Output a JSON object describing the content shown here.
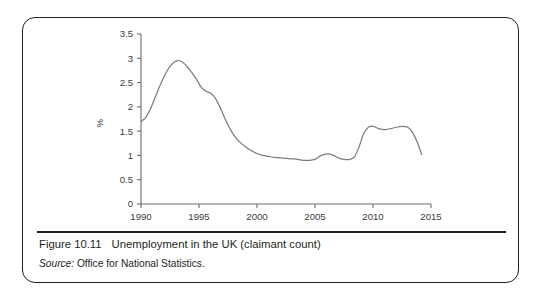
{
  "figure": {
    "number_label": "Figure 10.11",
    "title": "Unemployment in the UK (claimant count)",
    "source_label": "Source:",
    "source_text": " Office for National Statistics."
  },
  "colors": {
    "border": "#231f20",
    "series_line": "#7c7c7c",
    "axis": "#6b6b6b",
    "tick_text": "#3a3a3a",
    "background": "#ffffff"
  },
  "chart_data": {
    "type": "line",
    "title": "",
    "xlabel": "",
    "ylabel": "%",
    "xlim": [
      1990,
      2015
    ],
    "ylim": [
      0,
      3.5
    ],
    "grid": false,
    "legend": "none",
    "x_ticks": [
      "1990",
      "1995",
      "2000",
      "2005",
      "2010",
      "2015"
    ],
    "x_tick_values": [
      1990,
      1995,
      2000,
      2005,
      2010,
      2015
    ],
    "y_ticks": [
      "0",
      "0.5",
      "1",
      "1.5",
      "2",
      "2.5",
      "3",
      "3.5"
    ],
    "y_tick_values": [
      0,
      0.5,
      1,
      1.5,
      2,
      2.5,
      3,
      3.5
    ],
    "series": [
      {
        "name": "Unemployment (claimant count)",
        "color": "#7c7c7c",
        "x": [
          1990.0,
          1990.4,
          1990.8,
          1991.2,
          1991.6,
          1992.0,
          1992.4,
          1992.8,
          1993.2,
          1993.6,
          1994.0,
          1994.4,
          1994.8,
          1995.2,
          1995.6,
          1996.0,
          1996.4,
          1996.8,
          1997.2,
          1997.6,
          1998.0,
          1998.5,
          1999.0,
          1999.5,
          2000.0,
          2000.5,
          2001.0,
          2001.5,
          2002.0,
          2002.5,
          2003.0,
          2003.5,
          2004.0,
          2004.5,
          2005.0,
          2005.4,
          2005.8,
          2006.2,
          2006.6,
          2007.0,
          2007.5,
          2008.0,
          2008.4,
          2008.8,
          2009.2,
          2009.6,
          2010.0,
          2010.5,
          2011.0,
          2011.5,
          2012.0,
          2012.5,
          2013.0,
          2013.4,
          2013.8,
          2014.2
        ],
        "y": [
          1.7,
          1.78,
          1.95,
          2.18,
          2.42,
          2.63,
          2.8,
          2.91,
          2.95,
          2.92,
          2.82,
          2.7,
          2.56,
          2.4,
          2.32,
          2.28,
          2.18,
          2.0,
          1.78,
          1.58,
          1.42,
          1.28,
          1.18,
          1.1,
          1.04,
          1.0,
          0.98,
          0.96,
          0.95,
          0.94,
          0.93,
          0.92,
          0.9,
          0.9,
          0.92,
          0.98,
          1.02,
          1.03,
          1.0,
          0.95,
          0.92,
          0.92,
          0.97,
          1.18,
          1.45,
          1.58,
          1.6,
          1.55,
          1.53,
          1.55,
          1.58,
          1.6,
          1.58,
          1.48,
          1.28,
          1.02
        ]
      }
    ],
    "annotations": []
  }
}
